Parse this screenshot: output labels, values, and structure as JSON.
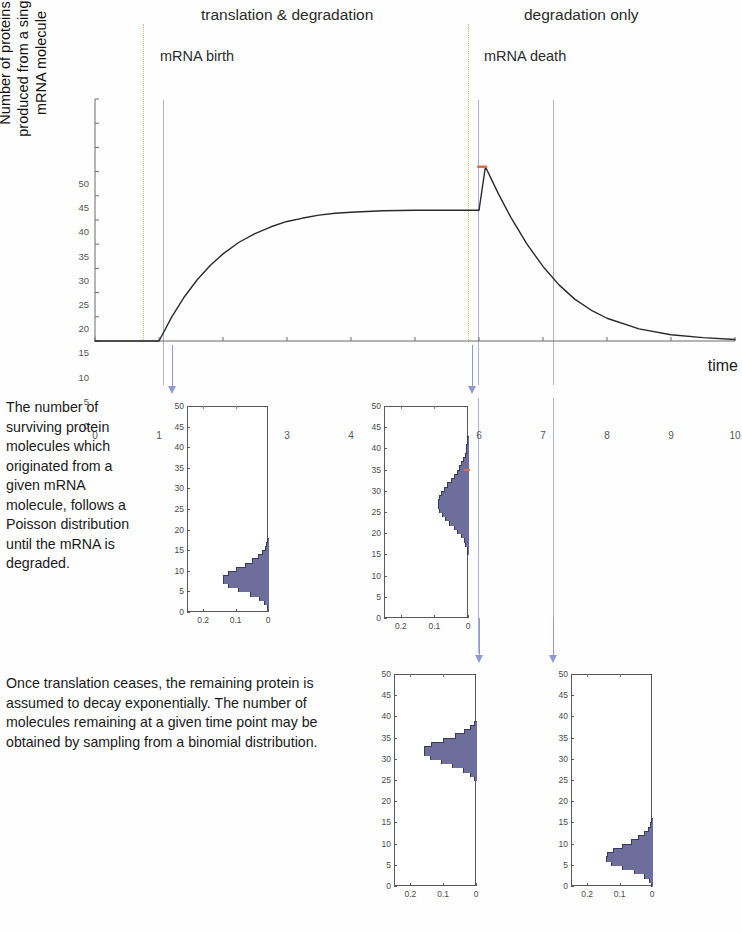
{
  "headings": {
    "left_section": "translation & degradation",
    "right_section": "degradation only",
    "left_event": "mRNA birth",
    "right_event": "mRNA death"
  },
  "main_plot": {
    "ylabel_lines": [
      "Number of proteins",
      "produced from a single",
      "mRNA molecule"
    ],
    "xlabel": "time",
    "y_ticks": [
      "0",
      "5",
      "10",
      "15",
      "20",
      "25",
      "30",
      "35",
      "40",
      "45",
      "50"
    ],
    "x_ticks": [
      "0",
      "1",
      "2",
      "3",
      "4",
      "5",
      "6",
      "7",
      "8",
      "9",
      "10"
    ],
    "ylim": [
      0,
      50
    ],
    "xlim": [
      0,
      10
    ],
    "curve_color": "#2a2a2a",
    "birth_time": 1.0,
    "death_time": 6.0,
    "plateau_value": 27,
    "peak_value": 36,
    "marker_color": "#e06a44"
  },
  "guides": {
    "dotted_color": "#e0b878",
    "blue_color": "#a9b3de",
    "arrow_color": "#8e9ad6",
    "dotted_at_times": [
      1.0,
      6.0
    ],
    "blue_at_times": [
      1.3,
      6.15,
      7.2
    ]
  },
  "paragraphs": {
    "poisson": "The number of surviving protein molecules which originated from a given mRNA molecule, follows a  Poisson distribution until the mRNA is degraded.",
    "binomial": "Once translation ceases, the remaining protein is assumed to decay exponentially. The number of molecules remaining at a given time point may be obtained by sampling from a binomial distribution."
  },
  "histograms": {
    "y_ticks": [
      "0",
      "5",
      "10",
      "15",
      "20",
      "25",
      "30",
      "35",
      "40",
      "45",
      "50"
    ],
    "x_ticks": [
      "0.2",
      "0.1",
      "0"
    ],
    "ylim": [
      0,
      50
    ],
    "xlim": [
      0,
      0.25
    ],
    "bar_color": "#6e6e9c",
    "bar_edge_color": "#3a3a5e",
    "panels": [
      {
        "id": "poisson-t1",
        "caption_ref": "poisson",
        "marker_value": null,
        "bins": [
          {
            "v": 0,
            "p": 0.0
          },
          {
            "v": 1,
            "p": 0.003
          },
          {
            "v": 2,
            "p": 0.011
          },
          {
            "v": 3,
            "p": 0.029
          },
          {
            "v": 4,
            "p": 0.057
          },
          {
            "v": 5,
            "p": 0.092
          },
          {
            "v": 6,
            "p": 0.122
          },
          {
            "v": 7,
            "p": 0.14
          },
          {
            "v": 8,
            "p": 0.14
          },
          {
            "v": 9,
            "p": 0.124
          },
          {
            "v": 10,
            "p": 0.099
          },
          {
            "v": 11,
            "p": 0.072
          },
          {
            "v": 12,
            "p": 0.048
          },
          {
            "v": 13,
            "p": 0.03
          },
          {
            "v": 14,
            "p": 0.017
          },
          {
            "v": 15,
            "p": 0.009
          },
          {
            "v": 16,
            "p": 0.005
          },
          {
            "v": 17,
            "p": 0.002
          },
          {
            "v": 18,
            "p": 0.001
          }
        ]
      },
      {
        "id": "poisson-t6",
        "caption_ref": "poisson",
        "marker_value": 35,
        "bins": [
          {
            "v": 15,
            "p": 0.002
          },
          {
            "v": 16,
            "p": 0.004
          },
          {
            "v": 17,
            "p": 0.008
          },
          {
            "v": 18,
            "p": 0.013
          },
          {
            "v": 19,
            "p": 0.021
          },
          {
            "v": 20,
            "p": 0.032
          },
          {
            "v": 21,
            "p": 0.043
          },
          {
            "v": 22,
            "p": 0.056
          },
          {
            "v": 23,
            "p": 0.068
          },
          {
            "v": 24,
            "p": 0.078
          },
          {
            "v": 25,
            "p": 0.085
          },
          {
            "v": 26,
            "p": 0.088
          },
          {
            "v": 27,
            "p": 0.088
          },
          {
            "v": 28,
            "p": 0.085
          },
          {
            "v": 29,
            "p": 0.079
          },
          {
            "v": 30,
            "p": 0.071
          },
          {
            "v": 31,
            "p": 0.062
          },
          {
            "v": 32,
            "p": 0.052
          },
          {
            "v": 33,
            "p": 0.043
          },
          {
            "v": 34,
            "p": 0.034
          },
          {
            "v": 35,
            "p": 0.026
          },
          {
            "v": 36,
            "p": 0.02
          },
          {
            "v": 37,
            "p": 0.014
          },
          {
            "v": 38,
            "p": 0.01
          },
          {
            "v": 39,
            "p": 0.007
          },
          {
            "v": 40,
            "p": 0.005
          },
          {
            "v": 41,
            "p": 0.003
          },
          {
            "v": 42,
            "p": 0.002
          },
          {
            "v": 43,
            "p": 0.001
          }
        ]
      },
      {
        "id": "binomial-t7",
        "caption_ref": "binomial",
        "marker_value": null,
        "bins": [
          {
            "v": 25,
            "p": 0.005
          },
          {
            "v": 26,
            "p": 0.018
          },
          {
            "v": 27,
            "p": 0.04
          },
          {
            "v": 28,
            "p": 0.072
          },
          {
            "v": 29,
            "p": 0.108
          },
          {
            "v": 30,
            "p": 0.141
          },
          {
            "v": 31,
            "p": 0.16
          },
          {
            "v": 32,
            "p": 0.158
          },
          {
            "v": 33,
            "p": 0.136
          },
          {
            "v": 34,
            "p": 0.101
          },
          {
            "v": 35,
            "p": 0.065
          },
          {
            "v": 36,
            "p": 0.036
          },
          {
            "v": 37,
            "p": 0.017
          },
          {
            "v": 38,
            "p": 0.006
          }
        ]
      },
      {
        "id": "binomial-t9",
        "caption_ref": "binomial",
        "marker_value": null,
        "bins": [
          {
            "v": 0,
            "p": 0.002
          },
          {
            "v": 1,
            "p": 0.009
          },
          {
            "v": 2,
            "p": 0.026
          },
          {
            "v": 3,
            "p": 0.056
          },
          {
            "v": 4,
            "p": 0.093
          },
          {
            "v": 5,
            "p": 0.126
          },
          {
            "v": 6,
            "p": 0.143
          },
          {
            "v": 7,
            "p": 0.14
          },
          {
            "v": 8,
            "p": 0.121
          },
          {
            "v": 9,
            "p": 0.093
          },
          {
            "v": 10,
            "p": 0.065
          },
          {
            "v": 11,
            "p": 0.042
          },
          {
            "v": 12,
            "p": 0.025
          },
          {
            "v": 13,
            "p": 0.013
          },
          {
            "v": 14,
            "p": 0.007
          },
          {
            "v": 15,
            "p": 0.003
          }
        ]
      }
    ]
  },
  "chart_data": {
    "type": "line",
    "title": "",
    "xlabel": "time",
    "ylabel": "Number of proteins produced from a single mRNA molecule",
    "xlim": [
      0,
      10
    ],
    "ylim": [
      0,
      50
    ],
    "grid": false,
    "legend": "none",
    "annotations": [
      {
        "text": "translation & degradation",
        "at_x": 3.4
      },
      {
        "text": "degradation only",
        "at_x": 8.0
      },
      {
        "text": "mRNA birth",
        "at_x": 1.0
      },
      {
        "text": "mRNA death",
        "at_x": 6.0
      }
    ],
    "series": [
      {
        "name": "mean protein count",
        "x": [
          0,
          0.5,
          1.0,
          1.2,
          1.4,
          1.6,
          1.8,
          2.0,
          2.25,
          2.5,
          2.75,
          3.0,
          3.25,
          3.5,
          3.75,
          4.0,
          4.5,
          5.0,
          5.5,
          6.0,
          6.1,
          6.3,
          6.5,
          6.75,
          7.0,
          7.25,
          7.5,
          7.75,
          8.0,
          8.5,
          9.0,
          9.5,
          10.0
        ],
        "y": [
          0,
          0,
          0,
          5.0,
          9.2,
          12.7,
          15.6,
          18.0,
          20.4,
          22.2,
          23.6,
          24.7,
          25.4,
          26.0,
          26.4,
          26.6,
          26.9,
          27.0,
          27.0,
          27.0,
          36.0,
          30.5,
          25.5,
          20.0,
          15.4,
          11.6,
          8.6,
          6.4,
          4.7,
          2.5,
          1.3,
          0.7,
          0.3
        ]
      }
    ],
    "markers": [
      {
        "x": 6.05,
        "y": 36,
        "color": "#e06a44"
      }
    ],
    "histograms_note": "four marginal distributions sampled at the dashed/blue guide times"
  }
}
